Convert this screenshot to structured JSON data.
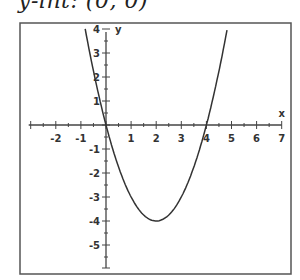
{
  "caption": "y-int:  (0, 0)",
  "chart_data": {
    "type": "line",
    "title": "",
    "function": "y = x^2 - 4x",
    "xlabel": "x",
    "ylabel": "y",
    "xlim": [
      -3,
      7
    ],
    "ylim": [
      -6,
      4
    ],
    "x_ticks": [
      -2,
      -1,
      1,
      2,
      3,
      4,
      5,
      6,
      7
    ],
    "y_ticks": [
      4,
      3,
      2,
      1,
      -1,
      -2,
      -3,
      -4,
      -5
    ],
    "grid": false,
    "series": [
      {
        "name": "parabola",
        "x": [
          -0.83,
          -0.5,
          0,
          0.5,
          1,
          1.5,
          2,
          2.5,
          3,
          3.5,
          4,
          4.5,
          4.83
        ],
        "y": [
          4,
          2.25,
          0,
          -1.75,
          -3,
          -3.75,
          -4,
          -3.75,
          -3,
          -1.75,
          0,
          2.25,
          4
        ]
      }
    ],
    "annotations": [
      "vertex (2, -4)",
      "x-intercepts (0, 0) and (4, 0)"
    ]
  }
}
